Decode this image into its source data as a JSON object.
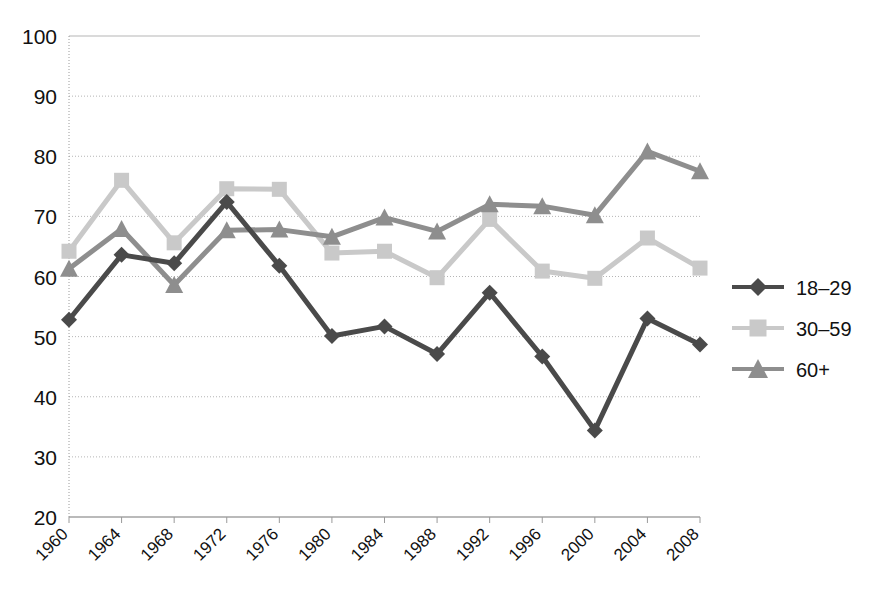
{
  "chart_data": {
    "type": "line",
    "title": "",
    "subtitle": "",
    "xlabel": "",
    "ylabel": "",
    "categories": [
      1960,
      1964,
      1968,
      1972,
      1976,
      1980,
      1984,
      1988,
      1992,
      1996,
      2000,
      2004,
      2008
    ],
    "xtick_labels": [
      "1960",
      "1964",
      "1968",
      "1972",
      "1976",
      "1980",
      "1984",
      "1988",
      "1992",
      "1996",
      "2000",
      "2004",
      "2008"
    ],
    "ytick_labels": [
      "20",
      "30",
      "40",
      "50",
      "60",
      "70",
      "80",
      "90",
      "100"
    ],
    "yticks": [
      20,
      30,
      40,
      50,
      60,
      70,
      80,
      90,
      100
    ],
    "ylim": [
      20,
      100
    ],
    "xlim": [
      1960,
      2008
    ],
    "grid": true,
    "legend_position": "right",
    "series": [
      {
        "name": "18–29",
        "marker": "diamond",
        "color": "#4a4a4a",
        "values": [
          52.8,
          63.6,
          62.2,
          72.4,
          61.8,
          50.1,
          51.7,
          47.1,
          57.3,
          46.7,
          34.4,
          53.0,
          48.7
        ]
      },
      {
        "name": "30–59",
        "marker": "square",
        "color": "#c9c9c9",
        "values": [
          64.2,
          76.0,
          65.6,
          74.6,
          74.5,
          63.9,
          64.2,
          59.8,
          69.5,
          60.9,
          59.7,
          66.4,
          61.4
        ]
      },
      {
        "name": "60+",
        "marker": "triangle",
        "color": "#8e8e8e",
        "values": [
          61.3,
          67.9,
          58.6,
          67.7,
          67.8,
          66.6,
          69.8,
          67.5,
          72.0,
          71.7,
          70.2,
          80.8,
          77.5
        ]
      }
    ]
  },
  "legend": {
    "items": [
      {
        "label": "18–29"
      },
      {
        "label": "30–59"
      },
      {
        "label": "60+"
      }
    ]
  },
  "axes": {
    "y_axis_name": "percent-axis",
    "x_axis_name": "year-axis"
  }
}
